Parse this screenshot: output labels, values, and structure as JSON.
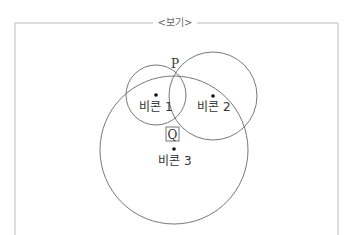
{
  "box": {
    "title": "<보기>"
  },
  "diagram": {
    "beacons": [
      {
        "id": "beacon-1",
        "label": "비콘 1"
      },
      {
        "id": "beacon-2",
        "label": "비콘 2"
      },
      {
        "id": "beacon-3",
        "label": "비콘 3"
      }
    ],
    "points": [
      {
        "id": "point-p",
        "label": "P"
      },
      {
        "id": "point-q",
        "label": "Q"
      }
    ],
    "colors": {
      "line": "#777777",
      "frame": "#bbbbbb",
      "dot": "#111111"
    }
  }
}
